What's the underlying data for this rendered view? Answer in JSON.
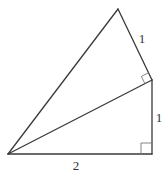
{
  "diagram": {
    "type": "geometry",
    "vertices": {
      "left": [
        8,
        154
      ],
      "bottom_right": [
        152,
        154
      ],
      "middle_right": [
        152,
        80
      ],
      "top": [
        118,
        9
      ]
    },
    "labels": {
      "bottom": "2",
      "right_vertical": "1",
      "upper_right": "1"
    },
    "right_angles": [
      "bottom_right",
      "middle_right"
    ],
    "colors": {
      "stroke": "#3a3a3a",
      "mark": "#777777",
      "text": "#333333"
    }
  }
}
